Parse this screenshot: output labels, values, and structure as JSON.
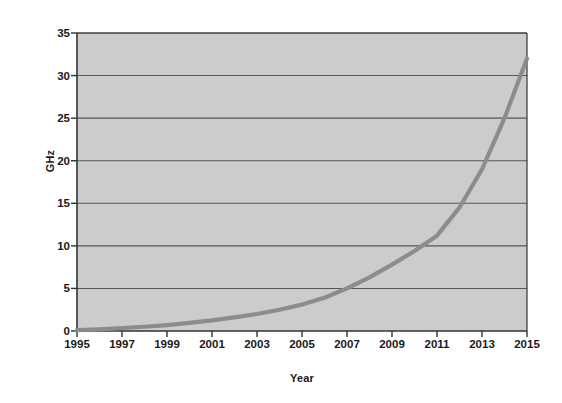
{
  "chart_data": {
    "type": "line",
    "title": "",
    "xlabel": "Year",
    "ylabel": "GHz",
    "xlim": [
      1995,
      2015
    ],
    "ylim": [
      0,
      35
    ],
    "grid": true,
    "legend": "none",
    "plot_background": "#cccccc",
    "line_color": "#8c8c8c",
    "gridline_color": "#555555",
    "axis_color": "#333333",
    "x_ticks": [
      1995,
      1997,
      1999,
      2001,
      2003,
      2005,
      2007,
      2009,
      2011,
      2013,
      2015
    ],
    "y_ticks": [
      0,
      5,
      10,
      15,
      20,
      25,
      30,
      35
    ],
    "series": [
      {
        "name": "Clock frequency",
        "x": [
          1995,
          1996,
          1997,
          1998,
          1999,
          2000,
          2001,
          2002,
          2003,
          2004,
          2005,
          2006,
          2007,
          2008,
          2009,
          2010,
          2011,
          2012,
          2013,
          2014,
          2015
        ],
        "values": [
          0.1,
          0.2,
          0.35,
          0.5,
          0.7,
          0.95,
          1.25,
          1.6,
          2.0,
          2.5,
          3.1,
          3.9,
          5.0,
          6.3,
          7.8,
          9.4,
          11.2,
          14.5,
          19.0,
          25.0,
          32.0
        ]
      }
    ]
  }
}
